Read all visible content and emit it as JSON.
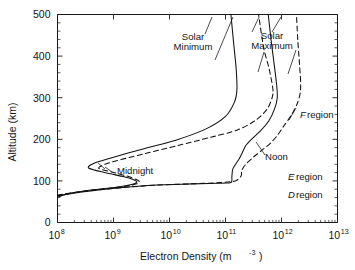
{
  "figure": {
    "background": "#ffffff",
    "axis_color": "#1a1a1a",
    "curve_color": "#111111"
  },
  "axes": {
    "x": {
      "title_main": "Electron Density (m",
      "title_sup": "-3",
      "title_tail": ")",
      "tick_mantissa": "10",
      "ticks": [
        {
          "exp": "8",
          "value": 8
        },
        {
          "exp": "9",
          "value": 9
        },
        {
          "exp": "10",
          "value": 10
        },
        {
          "exp": "11",
          "value": 11
        },
        {
          "exp": "12",
          "value": 12
        },
        {
          "exp": "13",
          "value": 13
        }
      ]
    },
    "y": {
      "title": "Altitude (km)",
      "ticks": [
        "0",
        "100",
        "200",
        "300",
        "400",
        "500"
      ]
    }
  },
  "annotations": {
    "solar_minimum_line1": "Solar",
    "solar_minimum_line2": "Minimum",
    "solar_maximum_line1": "Solar",
    "solar_maximum_line2": "Maximum",
    "midnight": "Midnight",
    "noon": "Noon",
    "f_region_letter": "F",
    "f_region_word": "region",
    "e_region_letter": "E",
    "e_region_word": "region",
    "d_region_letter": "D",
    "d_region_word": "region"
  },
  "chart_data": {
    "type": "line",
    "title": "",
    "xlabel": "Electron Density (m^-3)",
    "ylabel": "Altitude (km)",
    "xscale": "log",
    "xlim": [
      100000000.0,
      10000000000000.0
    ],
    "ylim": [
      0,
      500
    ],
    "xticks": [
      100000000.0,
      1000000000.0,
      10000000000.0,
      100000000000.0,
      1000000000000.0,
      10000000000000.0
    ],
    "yticks": [
      0,
      100,
      200,
      300,
      400,
      500
    ],
    "grid": false,
    "legend": "inline-annotations",
    "series": [
      {
        "name": "Solar Minimum - Midnight",
        "style": "solid",
        "points": [
          [
            105000000.0,
            62
          ],
          [
            160000000.0,
            70
          ],
          [
            400000000.0,
            78
          ],
          [
            1300000000.0,
            86
          ],
          [
            2200000000.0,
            92
          ],
          [
            2600000000.0,
            97
          ],
          [
            2300000000.0,
            103
          ],
          [
            1550000000.0,
            110
          ],
          [
            700000000.0,
            120
          ],
          [
            360000000.0,
            131
          ],
          [
            440000000.0,
            142
          ],
          [
            900000000.0,
            155
          ],
          [
            3000000000.0,
            175
          ],
          [
            13000000000.0,
            198
          ],
          [
            45000000000.0,
            225
          ],
          [
            100000000000.0,
            255
          ],
          [
            145000000000.0,
            290
          ],
          [
            160000000000.0,
            320
          ],
          [
            155000000000.0,
            370
          ],
          [
            140000000000.0,
            430
          ],
          [
            125000000000.0,
            500
          ]
        ]
      },
      {
        "name": "Solar Minimum - Noon",
        "style": "dashed",
        "points": [
          [
            100000000.0,
            64
          ],
          [
            200000000.0,
            72
          ],
          [
            600000000.0,
            80
          ],
          [
            1600000000.0,
            87
          ],
          [
            2600000000.0,
            93
          ],
          [
            2900000000.0,
            98
          ],
          [
            2500000000.0,
            104
          ],
          [
            1700000000.0,
            112
          ],
          [
            900000000.0,
            122
          ],
          [
            550000000.0,
            130
          ],
          [
            650000000.0,
            138
          ],
          [
            1100000000.0,
            148
          ],
          [
            3500000000.0,
            165
          ],
          [
            14000000000.0,
            185
          ],
          [
            55000000000.0,
            205
          ],
          [
            160000000000.0,
            222
          ],
          [
            340000000000.0,
            245
          ],
          [
            550000000000.0,
            272
          ],
          [
            680000000000.0,
            300
          ],
          [
            700000000000.0,
            322
          ],
          [
            600000000000.0,
            370
          ],
          [
            480000000000.0,
            420
          ],
          [
            390000000000.0,
            500
          ]
        ]
      },
      {
        "name": "Solar Maximum - Midnight",
        "style": "solid",
        "points": [
          [
            102000000.0,
            64
          ],
          [
            300000000.0,
            74
          ],
          [
            1200000000.0,
            83
          ],
          [
            4000000000.0,
            89
          ],
          [
            16000000000.0,
            92
          ],
          [
            50000000000.0,
            94
          ],
          [
            105000000000.0,
            95
          ],
          [
            128000000000.0,
            97
          ],
          [
            130000000000.0,
            110
          ],
          [
            133000000000.0,
            125
          ],
          [
            140000000000.0,
            133
          ],
          [
            170000000000.0,
            150
          ],
          [
            200000000000.0,
            168
          ],
          [
            230000000000.0,
            185
          ],
          [
            290000000000.0,
            200
          ],
          [
            420000000000.0,
            220
          ],
          [
            600000000000.0,
            245
          ],
          [
            760000000000.0,
            275
          ],
          [
            840000000000.0,
            300
          ],
          [
            820000000000.0,
            330
          ],
          [
            740000000000.0,
            380
          ],
          [
            650000000000.0,
            440
          ],
          [
            580000000000.0,
            500
          ]
        ]
      },
      {
        "name": "Solar Maximum - Noon",
        "style": "dashed",
        "points": [
          [
            100000000.0,
            66
          ],
          [
            350000000.0,
            76
          ],
          [
            1500000000.0,
            84
          ],
          [
            6000000000.0,
            90
          ],
          [
            25000000000.0,
            93
          ],
          [
            80000000000.0,
            96
          ],
          [
            150000000000.0,
            100
          ],
          [
            190000000000.0,
            112
          ],
          [
            195000000000.0,
            125
          ],
          [
            230000000000.0,
            140
          ],
          [
            320000000000.0,
            158
          ],
          [
            460000000000.0,
            175
          ],
          [
            650000000000.0,
            192
          ],
          [
            850000000000.0,
            210
          ],
          [
            1100000000000.0,
            232
          ],
          [
            1500000000000.0,
            258
          ],
          [
            1900000000000.0,
            285
          ],
          [
            2150000000000.0,
            310
          ],
          [
            2200000000000.0,
            335
          ],
          [
            2100000000000.0,
            380
          ],
          [
            1950000000000.0,
            440
          ],
          [
            1850000000000.0,
            500
          ]
        ]
      }
    ],
    "annotations": [
      {
        "text": "Solar Minimum",
        "x": 110000000000.0,
        "y": 450
      },
      {
        "text": "Solar Maximum",
        "x": 1000000000000.0,
        "y": 455
      },
      {
        "text": "Midnight",
        "x": 1500000000.0,
        "y": 135
      },
      {
        "text": "Noon",
        "x": 350000000000.0,
        "y": 133
      },
      {
        "text": "F region",
        "x": 2200000000000.0,
        "y": 265
      },
      {
        "text": "E region",
        "x": 3000000000000.0,
        "y": 105
      },
      {
        "text": "D region",
        "x": 3000000000000.0,
        "y": 75
      }
    ]
  }
}
